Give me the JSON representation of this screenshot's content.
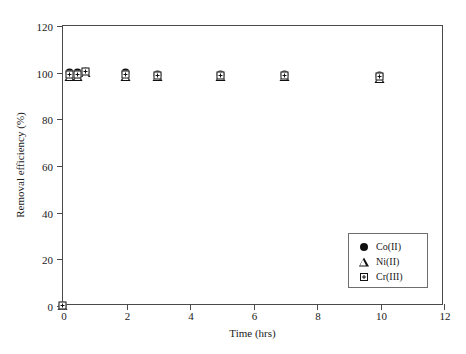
{
  "chart_data": {
    "type": "scatter",
    "title": "",
    "xlabel": "Time (hrs)",
    "ylabel": "Removal efficiency (%)",
    "xlim": [
      0,
      12
    ],
    "ylim": [
      0,
      120
    ],
    "xticks": [
      0,
      2,
      4,
      6,
      8,
      10,
      12
    ],
    "yticks": [
      0,
      20,
      40,
      60,
      80,
      100,
      120
    ],
    "grid": false,
    "legend_position": "lower-right",
    "x": [
      0,
      0.25,
      0.5,
      0.75,
      2,
      3,
      5,
      7,
      10
    ],
    "series": [
      {
        "name": "Co(II)",
        "marker": "filled-circle",
        "color": "#111111",
        "values": [
          0,
          99.5,
          99.5,
          100,
          99.5,
          99,
          99,
          99,
          98.5
        ]
      },
      {
        "name": "Ni(II)",
        "marker": "open-triangle",
        "color": "#111111",
        "values": [
          0,
          98,
          98,
          99.5,
          98,
          98,
          98,
          98,
          97
        ]
      },
      {
        "name": "Cr(III)",
        "marker": "crossed-square",
        "color": "#111111",
        "values": [
          0,
          99,
          99,
          100,
          99,
          98.5,
          98.5,
          98.5,
          98
        ]
      }
    ]
  },
  "legend": {
    "entries": [
      {
        "label": "Co(II)"
      },
      {
        "label": "Ni(II)"
      },
      {
        "label": "Cr(III)"
      }
    ]
  },
  "axes": {
    "x_tick_labels": [
      "0",
      "2",
      "4",
      "6",
      "8",
      "10",
      "12"
    ],
    "y_tick_labels": [
      "0",
      "20",
      "40",
      "60",
      "80",
      "100",
      "120"
    ]
  }
}
